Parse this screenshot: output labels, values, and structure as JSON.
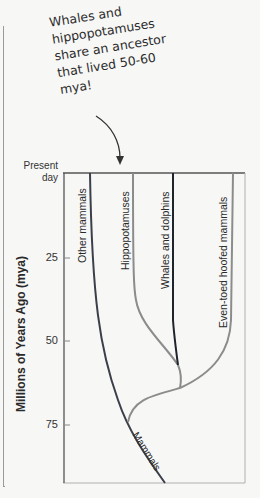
{
  "annotation": {
    "text": "Whales and\nhippopotamuses\nshare an ancestor\nthat lived 50-60\nmya!"
  },
  "axis": {
    "title": "Millions of Years Ago (mya)",
    "present_label": "Present\nday",
    "ticks": [
      "25",
      "50",
      "75"
    ]
  },
  "branches": {
    "other_mammals": "Other mammals",
    "hippopotamuses": "Hippopotamuses",
    "whales_dolphins": "Whales and dolphins",
    "even_toed": "Even-toed hoofed mammals",
    "mammals": "Mammals"
  },
  "colors": {
    "dark_line": "#3b3f4a",
    "gray_line": "#8c8c8c",
    "frame": "#a9a9a9"
  }
}
